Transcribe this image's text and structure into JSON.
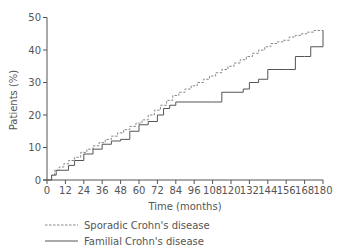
{
  "chart_data": {
    "type": "line",
    "title": "",
    "xlabel": "Time (months)",
    "ylabel": "Patients (%)",
    "xlim": [
      0,
      180
    ],
    "ylim": [
      0,
      50
    ],
    "xticks": [
      0,
      12,
      24,
      36,
      48,
      60,
      72,
      84,
      96,
      108,
      120,
      132,
      144,
      156,
      168,
      180
    ],
    "yticks": [
      0,
      10,
      20,
      30,
      40,
      50
    ],
    "grid": false,
    "legend_position": "bottom-left",
    "step": true,
    "series": [
      {
        "name": "Sporadic Crohn's disease",
        "style": "dashed",
        "color": "#888888",
        "x": [
          0,
          3,
          5,
          8,
          11,
          14,
          18,
          22,
          26,
          30,
          34,
          38,
          42,
          46,
          50,
          54,
          58,
          62,
          66,
          70,
          74,
          78,
          82,
          86,
          90,
          94,
          98,
          102,
          106,
          110,
          114,
          118,
          122,
          126,
          130,
          134,
          138,
          142,
          146,
          150,
          154,
          158,
          162,
          166,
          170,
          174,
          178,
          180
        ],
        "y": [
          0,
          1.5,
          3,
          4,
          5,
          6,
          7,
          8.5,
          9.5,
          10.5,
          11.5,
          12.5,
          13.5,
          14.5,
          15.5,
          16.5,
          17.5,
          18.5,
          20,
          21.5,
          23,
          24.5,
          26,
          27,
          28,
          29,
          30,
          31,
          32,
          33,
          34,
          35,
          36,
          37,
          38,
          39,
          40,
          41,
          42,
          42.5,
          43,
          44,
          44.5,
          45,
          45.5,
          46,
          46,
          46
        ]
      },
      {
        "name": "Familial Crohn's disease",
        "style": "solid",
        "color": "#555555",
        "x": [
          0,
          3,
          6,
          14,
          18,
          24,
          30,
          36,
          42,
          48,
          54,
          60,
          66,
          72,
          76,
          80,
          84,
          96,
          108,
          114,
          120,
          128,
          132,
          138,
          144,
          150,
          156,
          162,
          168,
          172,
          176,
          180
        ],
        "y": [
          0,
          1.5,
          3,
          4.5,
          6,
          8,
          9.5,
          11,
          12,
          12.5,
          15,
          17,
          18,
          20,
          22,
          23,
          24,
          24,
          24,
          27,
          27,
          28,
          30,
          31,
          34,
          34,
          34,
          38,
          38,
          41,
          41,
          46
        ]
      }
    ]
  },
  "legend": {
    "items": [
      {
        "label": "Sporadic Crohn's disease",
        "style": "dashed"
      },
      {
        "label": "Familial Crohn's disease",
        "style": "solid"
      }
    ]
  },
  "axes": {
    "xlabel": "Time (months)",
    "ylabel": "Patients (%)"
  }
}
